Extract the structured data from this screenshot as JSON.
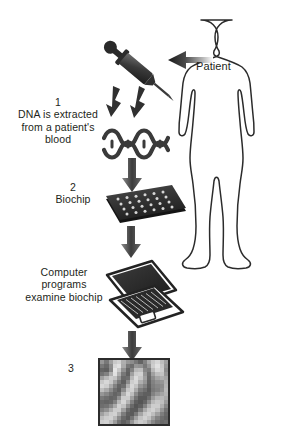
{
  "diagram": {
    "background_color": "#ffffff",
    "ink_color": "#231f20"
  },
  "labels": {
    "patient": "Patient",
    "step1_number": "1",
    "step1_text": "DNA is extracted\nfrom a patient's\nblood",
    "step2_number": "2",
    "step2_text": "Biochip",
    "step3_number": "3",
    "computer_text": "Computer\nprograms\nexamine biochip"
  },
  "nodes": [
    {
      "name": "patient-figure",
      "type": "human-silhouette",
      "label": "Patient"
    },
    {
      "name": "syringe",
      "type": "syringe-icon"
    },
    {
      "name": "dna-helix",
      "type": "dna-double-helix-icon"
    },
    {
      "name": "biochip",
      "type": "biochip-grid-icon"
    },
    {
      "name": "laptop",
      "type": "laptop-icon"
    },
    {
      "name": "microarray-result",
      "type": "microarray-heatmap"
    }
  ],
  "arrows": [
    {
      "name": "arrow-patient-to-syringe",
      "direction": "left"
    },
    {
      "name": "arrow-syringe-to-dna-left",
      "direction": "down"
    },
    {
      "name": "arrow-syringe-to-dna-right",
      "direction": "down"
    },
    {
      "name": "arrow-dna-to-biochip",
      "direction": "down"
    },
    {
      "name": "arrow-biochip-to-laptop",
      "direction": "down"
    },
    {
      "name": "arrow-laptop-to-microarray",
      "direction": "down"
    }
  ],
  "chart_data": {
    "type": "heatmap",
    "rows": 16,
    "cols": 16,
    "colormap": "grayscale",
    "vmin": 0,
    "vmax": 255,
    "values": [
      [
        150,
        120,
        160,
        200,
        210,
        175,
        150,
        140,
        120,
        100,
        130,
        170,
        200,
        215,
        190,
        160
      ],
      [
        120,
        105,
        140,
        215,
        225,
        170,
        120,
        110,
        150,
        145,
        120,
        150,
        205,
        225,
        200,
        150
      ],
      [
        100,
        95,
        135,
        230,
        200,
        145,
        100,
        130,
        185,
        190,
        135,
        125,
        185,
        215,
        205,
        140
      ],
      [
        115,
        130,
        175,
        225,
        175,
        120,
        95,
        160,
        205,
        210,
        150,
        110,
        160,
        190,
        195,
        150
      ],
      [
        160,
        185,
        205,
        195,
        150,
        105,
        110,
        185,
        220,
        200,
        160,
        105,
        140,
        165,
        175,
        165
      ],
      [
        200,
        215,
        200,
        160,
        120,
        95,
        140,
        205,
        215,
        175,
        150,
        100,
        130,
        145,
        150,
        175
      ],
      [
        215,
        205,
        170,
        130,
        100,
        110,
        175,
        215,
        195,
        150,
        130,
        95,
        125,
        135,
        140,
        180
      ],
      [
        190,
        170,
        140,
        110,
        95,
        140,
        200,
        210,
        170,
        125,
        110,
        90,
        120,
        130,
        145,
        185
      ],
      [
        150,
        135,
        115,
        100,
        110,
        175,
        215,
        190,
        140,
        105,
        95,
        95,
        130,
        150,
        165,
        180
      ],
      [
        120,
        110,
        100,
        105,
        145,
        205,
        205,
        160,
        115,
        90,
        90,
        110,
        155,
        180,
        185,
        170
      ],
      [
        105,
        100,
        105,
        130,
        185,
        215,
        180,
        130,
        95,
        85,
        100,
        140,
        185,
        200,
        190,
        155
      ],
      [
        110,
        115,
        135,
        170,
        210,
        195,
        145,
        105,
        85,
        95,
        130,
        175,
        205,
        205,
        175,
        135
      ],
      [
        130,
        145,
        175,
        205,
        205,
        160,
        110,
        90,
        90,
        125,
        170,
        200,
        210,
        190,
        150,
        115
      ],
      [
        160,
        185,
        205,
        210,
        175,
        125,
        95,
        90,
        120,
        165,
        200,
        210,
        190,
        160,
        125,
        105
      ],
      [
        190,
        205,
        210,
        185,
        140,
        105,
        90,
        115,
        160,
        195,
        210,
        195,
        160,
        130,
        110,
        100
      ],
      [
        205,
        210,
        190,
        155,
        115,
        95,
        110,
        150,
        190,
        205,
        195,
        165,
        135,
        115,
        105,
        110
      ]
    ]
  }
}
